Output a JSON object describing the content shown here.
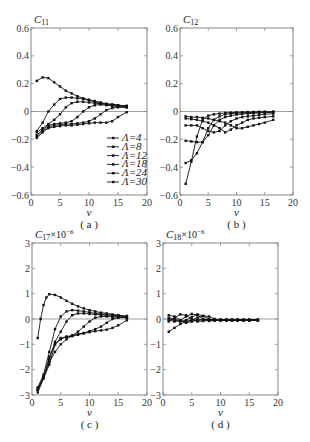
{
  "figure": {
    "captions": [
      "(a)",
      "(b)",
      "(c)",
      "(d)"
    ]
  },
  "chart_data": [
    {
      "type": "line",
      "panel": "a",
      "title": "C11",
      "ylabel": "C11",
      "xlabel": "v",
      "caption": "(a)",
      "xlim": [
        0,
        20
      ],
      "ylim": [
        -0.6,
        0.6
      ],
      "xticks": [
        0,
        5,
        10,
        15,
        20
      ],
      "yticks": [
        -0.6,
        -0.4,
        -0.2,
        0,
        0.2,
        0.4,
        0.6
      ],
      "ytick_labels": [
        "-0.6",
        "-0.4",
        "-0.2",
        "0",
        "0.2",
        "0.4",
        "0.6"
      ],
      "legend": [
        "Λ=4",
        "Λ=8",
        "Λ=12",
        "Λ=18",
        "Λ=24",
        "Λ=30"
      ],
      "legend_position": "lower right",
      "frame": {
        "x0": 31,
        "x1": 147,
        "y0": 28,
        "y1": 195
      },
      "series": [
        {
          "name": "Λ=4",
          "x": [
            1,
            2,
            3,
            4,
            5,
            6,
            7,
            8,
            9,
            10,
            11,
            12,
            13,
            14,
            15,
            16.5
          ],
          "y": [
            0.22,
            0.245,
            0.24,
            0.21,
            0.18,
            0.15,
            0.13,
            0.11,
            0.095,
            0.085,
            0.075,
            0.065,
            0.055,
            0.05,
            0.045,
            0.04
          ]
        },
        {
          "name": "Λ=8",
          "x": [
            1,
            2,
            3,
            4,
            5,
            6,
            7,
            8,
            9,
            10,
            11,
            12,
            13,
            14,
            15,
            16.5
          ],
          "y": [
            -0.14,
            -0.08,
            0.0,
            0.05,
            0.09,
            0.1,
            0.1,
            0.095,
            0.09,
            0.08,
            0.07,
            0.06,
            0.055,
            0.05,
            0.045,
            0.04
          ]
        },
        {
          "name": "Λ=12",
          "x": [
            1,
            2,
            3,
            4,
            5,
            6,
            7,
            8,
            9,
            10,
            11,
            12,
            13,
            14,
            15,
            16.5
          ],
          "y": [
            -0.15,
            -0.12,
            -0.09,
            -0.06,
            -0.02,
            0.03,
            0.06,
            0.07,
            0.07,
            0.065,
            0.06,
            0.055,
            0.05,
            0.045,
            0.04,
            0.035
          ]
        },
        {
          "name": "Λ=18",
          "x": [
            1,
            2,
            3,
            4,
            5,
            6,
            7,
            8,
            9,
            10,
            11,
            12,
            13,
            14,
            15,
            16.5
          ],
          "y": [
            -0.17,
            -0.13,
            -0.1,
            -0.09,
            -0.085,
            -0.08,
            -0.07,
            -0.04,
            0.0,
            0.03,
            0.045,
            0.05,
            0.045,
            0.04,
            0.035,
            0.03
          ]
        },
        {
          "name": "Λ=24",
          "x": [
            1,
            2,
            3,
            4,
            5,
            6,
            7,
            8,
            9,
            10,
            11,
            12,
            13,
            14,
            15,
            16.5
          ],
          "y": [
            -0.18,
            -0.14,
            -0.11,
            -0.1,
            -0.095,
            -0.09,
            -0.09,
            -0.085,
            -0.08,
            -0.07,
            -0.05,
            -0.02,
            0.01,
            0.025,
            0.03,
            0.03
          ]
        },
        {
          "name": "Λ=30",
          "x": [
            1,
            2,
            3,
            4,
            5,
            6,
            7,
            8,
            9,
            10,
            11,
            12,
            13,
            14,
            15,
            16.5
          ],
          "y": [
            -0.19,
            -0.15,
            -0.12,
            -0.11,
            -0.105,
            -0.1,
            -0.1,
            -0.095,
            -0.09,
            -0.085,
            -0.08,
            -0.08,
            -0.08,
            -0.07,
            -0.04,
            -0.005
          ]
        }
      ]
    },
    {
      "type": "line",
      "panel": "b",
      "title": "C12",
      "ylabel": "C12",
      "xlabel": "v",
      "caption": "(b)",
      "xlim": [
        0,
        20
      ],
      "ylim": [
        -0.6,
        0.6
      ],
      "xticks": [
        0,
        5,
        10,
        15,
        20
      ],
      "yticks": [
        -0.6,
        -0.4,
        -0.2,
        0,
        0.2,
        0.4,
        0.6
      ],
      "ytick_labels": [
        "-0.6",
        "-0.4",
        "-0.2",
        "0",
        "0.2",
        "0.4",
        "0.6"
      ],
      "frame": {
        "x0": 180,
        "x1": 293,
        "y0": 28,
        "y1": 195
      },
      "series": [
        {
          "name": "Λ=4",
          "x": [
            1,
            2,
            3,
            4,
            5,
            6,
            7,
            8,
            9,
            10,
            11,
            12,
            13,
            14,
            15,
            16.5
          ],
          "y": [
            -0.52,
            -0.36,
            -0.18,
            -0.06,
            -0.03,
            -0.02,
            -0.015,
            -0.01,
            -0.008,
            -0.006,
            -0.005,
            -0.004,
            -0.003,
            -0.002,
            -0.002,
            -0.001
          ]
        },
        {
          "name": "Λ=8",
          "x": [
            1,
            2,
            3,
            4,
            5,
            6,
            7,
            8,
            9,
            10,
            11,
            12,
            13,
            14,
            15,
            16.5
          ],
          "y": [
            -0.37,
            -0.35,
            -0.3,
            -0.22,
            -0.12,
            -0.06,
            -0.035,
            -0.02,
            -0.015,
            -0.012,
            -0.01,
            -0.008,
            -0.006,
            -0.005,
            -0.004,
            -0.003
          ]
        },
        {
          "name": "Λ=12",
          "x": [
            1,
            2,
            3,
            4,
            5,
            6,
            7,
            8,
            9,
            10,
            11,
            12,
            13,
            14,
            15,
            16.5
          ],
          "y": [
            -0.21,
            -0.215,
            -0.22,
            -0.22,
            -0.17,
            -0.1,
            -0.06,
            -0.04,
            -0.03,
            -0.022,
            -0.018,
            -0.015,
            -0.012,
            -0.01,
            -0.008,
            -0.006
          ]
        },
        {
          "name": "Λ=18",
          "x": [
            1,
            2,
            3,
            4,
            5,
            6,
            7,
            8,
            9,
            10,
            11,
            12,
            13,
            14,
            15,
            16.5
          ],
          "y": [
            -0.1,
            -0.1,
            -0.1,
            -0.12,
            -0.14,
            -0.15,
            -0.14,
            -0.1,
            -0.07,
            -0.05,
            -0.04,
            -0.035,
            -0.03,
            -0.025,
            -0.02,
            -0.015
          ]
        },
        {
          "name": "Λ=24",
          "x": [
            1,
            2,
            3,
            4,
            5,
            6,
            7,
            8,
            9,
            10,
            11,
            12,
            13,
            14,
            15,
            16.5
          ],
          "y": [
            -0.05,
            -0.055,
            -0.06,
            -0.07,
            -0.08,
            -0.1,
            -0.12,
            -0.15,
            -0.13,
            -0.1,
            -0.08,
            -0.06,
            -0.05,
            -0.045,
            -0.04,
            -0.035
          ]
        },
        {
          "name": "Λ=30",
          "x": [
            1,
            2,
            3,
            4,
            5,
            6,
            7,
            8,
            9,
            10,
            11,
            12,
            13,
            14,
            15,
            16.5
          ],
          "y": [
            -0.035,
            -0.04,
            -0.04,
            -0.045,
            -0.05,
            -0.06,
            -0.07,
            -0.08,
            -0.1,
            -0.12,
            -0.12,
            -0.11,
            -0.1,
            -0.09,
            -0.08,
            -0.06
          ]
        }
      ]
    },
    {
      "type": "line",
      "panel": "c",
      "title": "C17×10^-6",
      "ylabel": "C17×10^-6",
      "xlabel": "v",
      "caption": "(c)",
      "xlim": [
        0,
        20
      ],
      "ylim": [
        -3,
        3
      ],
      "xticks": [
        0,
        5,
        10,
        15,
        20
      ],
      "yticks": [
        -3,
        -2,
        -1,
        0,
        1,
        2,
        3
      ],
      "ytick_labels": [
        "-3",
        "-2",
        "-1",
        "0",
        "1",
        "2",
        "3"
      ],
      "frame": {
        "x0": 32,
        "x1": 147,
        "y0": 243,
        "y1": 395
      },
      "series": [
        {
          "name": "Λ=4",
          "x": [
            1,
            1.5,
            2,
            2.5,
            3,
            4,
            5,
            6,
            7,
            8,
            9,
            10,
            11,
            12,
            13,
            14,
            15,
            16.5
          ],
          "y": [
            -0.75,
            0.0,
            0.55,
            0.85,
            0.98,
            0.95,
            0.85,
            0.72,
            0.6,
            0.5,
            0.42,
            0.35,
            0.3,
            0.25,
            0.22,
            0.18,
            0.15,
            0.12
          ]
        },
        {
          "name": "Λ=8",
          "x": [
            1,
            2,
            3,
            4,
            5,
            6,
            7,
            8,
            9,
            10,
            11,
            12,
            13,
            14,
            15,
            16.5
          ],
          "y": [
            -2.7,
            -2.2,
            -1.3,
            -0.4,
            0.1,
            0.3,
            0.35,
            0.33,
            0.3,
            0.26,
            0.22,
            0.2,
            0.18,
            0.15,
            0.13,
            0.1
          ]
        },
        {
          "name": "Λ=12",
          "x": [
            1,
            2,
            3,
            4,
            5,
            6,
            7,
            8,
            9,
            10,
            11,
            12,
            13,
            14,
            15,
            16.5
          ],
          "y": [
            -2.8,
            -2.3,
            -1.6,
            -0.9,
            -0.5,
            -0.1,
            0.15,
            0.22,
            0.22,
            0.2,
            0.18,
            0.16,
            0.14,
            0.12,
            0.1,
            0.08
          ]
        },
        {
          "name": "Λ=18",
          "x": [
            1,
            2,
            3,
            4,
            5,
            6,
            7,
            8,
            9,
            10,
            11,
            12,
            13,
            14,
            15,
            16.5
          ],
          "y": [
            -2.75,
            -2.3,
            -1.7,
            -1.3,
            -1.0,
            -0.8,
            -0.65,
            -0.5,
            -0.3,
            -0.1,
            0.05,
            0.1,
            0.1,
            0.08,
            0.07,
            0.05
          ]
        },
        {
          "name": "Λ=24",
          "x": [
            1,
            2,
            3,
            4,
            5,
            6,
            7,
            8,
            9,
            10,
            11,
            12,
            13,
            14,
            15,
            16.5
          ],
          "y": [
            -2.8,
            -2.3,
            -1.5,
            -1.0,
            -0.8,
            -0.7,
            -0.65,
            -0.6,
            -0.55,
            -0.48,
            -0.4,
            -0.3,
            -0.15,
            0.0,
            0.05,
            0.05
          ]
        },
        {
          "name": "Λ=30",
          "x": [
            1,
            2,
            3,
            4,
            5,
            6,
            7,
            8,
            9,
            10,
            11,
            12,
            13,
            14,
            15,
            16.5
          ],
          "y": [
            -2.9,
            -2.35,
            -1.8,
            -1.0,
            -0.75,
            -0.7,
            -0.68,
            -0.62,
            -0.57,
            -0.52,
            -0.48,
            -0.45,
            -0.42,
            -0.35,
            -0.25,
            -0.05
          ]
        }
      ]
    },
    {
      "type": "line",
      "panel": "d",
      "title": "C18×10^-6",
      "ylabel": "C18×10^-6",
      "xlabel": "v",
      "caption": "(d)",
      "xlim": [
        0,
        20
      ],
      "ylim": [
        -3,
        3
      ],
      "xticks": [
        0,
        5,
        10,
        15,
        20
      ],
      "yticks": [
        -3,
        -2,
        -1,
        0,
        1,
        2,
        3
      ],
      "ytick_labels": [
        "-3",
        "-2",
        "-1",
        "0",
        "1",
        "2",
        "3"
      ],
      "frame": {
        "x0": 163,
        "x1": 278,
        "y0": 243,
        "y1": 395
      },
      "series": [
        {
          "name": "Λ=4",
          "x": [
            1,
            2,
            3,
            4,
            5,
            6,
            7,
            8,
            9,
            10,
            11,
            12,
            13,
            14,
            15,
            16.5
          ],
          "y": [
            -0.5,
            -0.35,
            -0.2,
            -0.1,
            -0.05,
            -0.03,
            -0.02,
            -0.02,
            -0.02,
            -0.02,
            -0.02,
            -0.02,
            -0.02,
            -0.02,
            -0.02,
            -0.02
          ]
        },
        {
          "name": "Λ=8",
          "x": [
            1,
            2,
            3,
            4,
            5,
            6,
            7,
            8,
            9,
            10,
            11,
            12,
            13,
            14,
            15,
            16.5
          ],
          "y": [
            0.15,
            0.1,
            -0.05,
            -0.15,
            -0.1,
            -0.05,
            -0.03,
            -0.03,
            -0.03,
            -0.03,
            -0.03,
            -0.03,
            -0.03,
            -0.03,
            -0.03,
            -0.03
          ]
        },
        {
          "name": "Λ=12",
          "x": [
            1,
            2,
            3,
            4,
            5,
            6,
            7,
            8,
            9,
            10,
            11,
            12,
            13,
            14,
            15,
            16.5
          ],
          "y": [
            -0.1,
            0.05,
            0.18,
            0.15,
            0.0,
            -0.1,
            -0.08,
            -0.05,
            -0.04,
            -0.04,
            -0.04,
            -0.04,
            -0.04,
            -0.04,
            -0.04,
            -0.04
          ]
        },
        {
          "name": "Λ=18",
          "x": [
            1,
            2,
            3,
            4,
            5,
            6,
            7,
            8,
            9,
            10,
            11,
            12,
            13,
            14,
            15,
            16.5
          ],
          "y": [
            -0.05,
            -0.1,
            -0.05,
            0.1,
            0.2,
            0.15,
            0.0,
            -0.08,
            -0.06,
            -0.05,
            -0.05,
            -0.05,
            -0.05,
            -0.05,
            -0.05,
            -0.05
          ]
        },
        {
          "name": "Λ=24",
          "x": [
            1,
            2,
            3,
            4,
            5,
            6,
            7,
            8,
            9,
            10,
            11,
            12,
            13,
            14,
            15,
            16.5
          ],
          "y": [
            0.0,
            -0.05,
            -0.1,
            -0.05,
            0.08,
            0.18,
            0.12,
            0.0,
            -0.06,
            -0.06,
            -0.06,
            -0.06,
            -0.06,
            -0.06,
            -0.06,
            -0.06
          ]
        },
        {
          "name": "Λ=30",
          "x": [
            1,
            2,
            3,
            4,
            5,
            6,
            7,
            8,
            9,
            10,
            11,
            12,
            13,
            14,
            15,
            16.5
          ],
          "y": [
            0.05,
            0.0,
            -0.08,
            -0.1,
            -0.05,
            0.05,
            0.12,
            0.1,
            0.0,
            -0.05,
            -0.06,
            -0.06,
            -0.06,
            -0.06,
            -0.06,
            -0.06
          ]
        }
      ]
    }
  ]
}
